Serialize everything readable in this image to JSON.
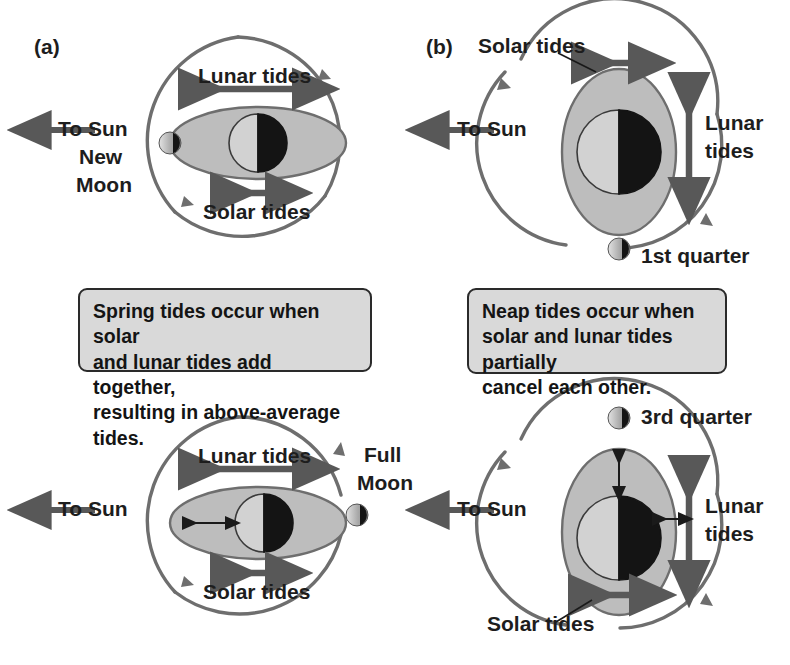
{
  "figure": {
    "colors": {
      "orbit_line": "#6e6e6e",
      "bulge_fill": "#bdbdbd",
      "bulge_stroke": "#6e6e6e",
      "earth_light": "#cccccc",
      "earth_dark": "#1a1a1a",
      "arrow": "#585858",
      "thin_arrow": "#1a1a1a",
      "callout_fill": "#d9d9d9",
      "callout_stroke": "#2a2a2a",
      "text": "#1a1a1a",
      "background": "#ffffff"
    }
  },
  "panels": {
    "a": {
      "tag": "(a)",
      "caption": {
        "line1": "Spring tides occur when solar",
        "line2": "and lunar tides add together,",
        "line3": "resulting in above-average tides."
      },
      "top": {
        "name": "new-moon-diagram",
        "sun_label": "To Sun",
        "moon_label_line1": "New",
        "moon_label_line2": "Moon",
        "moon_phase": "new",
        "lunar_tides_label": "Lunar tides",
        "solar_tides_label": "Solar tides",
        "bulge_orientation": "horizontal",
        "lunar_arrow_length": "long",
        "solar_arrow_length": "short"
      },
      "bottom": {
        "name": "full-moon-diagram",
        "sun_label": "To Sun",
        "moon_label_line1": "Full",
        "moon_label_line2": "Moon",
        "moon_phase": "full",
        "lunar_tides_label": "Lunar tides",
        "solar_tides_label": "Solar tides",
        "bulge_orientation": "horizontal",
        "lunar_arrow_length": "long",
        "solar_arrow_length": "short"
      }
    },
    "b": {
      "tag": "(b)",
      "caption": {
        "line1": "Neap tides occur when",
        "line2": "solar and lunar tides partially",
        "line3": "cancel each other."
      },
      "top": {
        "name": "first-quarter-diagram",
        "sun_label": "To Sun",
        "moon_label": "1st quarter",
        "moon_phase": "first-quarter",
        "lunar_tides_label_line1": "Lunar",
        "lunar_tides_label_line2": "tides",
        "solar_tides_label": "Solar tides",
        "bulge_orientation": "vertical",
        "lunar_arrow_length": "long",
        "solar_arrow_length": "short"
      },
      "bottom": {
        "name": "third-quarter-diagram",
        "sun_label": "To Sun",
        "moon_label": "3rd quarter",
        "moon_phase": "third-quarter",
        "lunar_tides_label_line1": "Lunar",
        "lunar_tides_label_line2": "tides",
        "solar_tides_label": "Solar tides",
        "bulge_orientation": "vertical",
        "lunar_arrow_length": "long",
        "solar_arrow_length": "short"
      }
    }
  }
}
